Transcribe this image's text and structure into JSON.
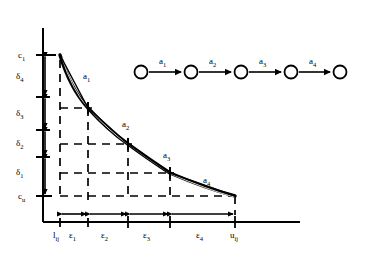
{
  "figure": {
    "stroke_color": "#000000",
    "background": "#ffffff"
  },
  "axes": {
    "y_axis_name": "cost-axis",
    "x_axis_name": "flow-axis",
    "origin": {
      "x": 43,
      "y": 222
    },
    "y_top": {
      "x": 43,
      "y": 28
    },
    "x_right": {
      "x": 300,
      "y": 222
    }
  },
  "y_labels": [
    {
      "id": "c1",
      "text": "c",
      "sub": "1",
      "y": 55
    },
    {
      "id": "delta4",
      "text": "δ",
      "sub": "4",
      "y": 76
    },
    {
      "id": "delta3",
      "text": "δ",
      "sub": "3",
      "y": 113
    },
    {
      "id": "delta2",
      "text": "δ",
      "sub": "2",
      "y": 143
    },
    {
      "id": "delta1",
      "text": "δ",
      "sub": "1",
      "y": 172
    },
    {
      "id": "cu",
      "text": "c",
      "sub": "u",
      "y": 196
    }
  ],
  "y_ticks": [
    55,
    97,
    130,
    157,
    196
  ],
  "delta_spans": [
    {
      "label": "delta4",
      "y_from": 55,
      "y_to": 97
    },
    {
      "label": "delta3",
      "y_from": 97,
      "y_to": 130
    },
    {
      "label": "delta2",
      "y_from": 130,
      "y_to": 157
    },
    {
      "label": "delta1",
      "y_from": 157,
      "y_to": 196
    }
  ],
  "x_labels": [
    {
      "id": "l_ij",
      "text": "l",
      "sub": "ij",
      "x": 58
    },
    {
      "id": "eps1",
      "text": "ε",
      "sub": "1",
      "x": 77
    },
    {
      "id": "eps2",
      "text": "ε",
      "sub": "2",
      "x": 108
    },
    {
      "id": "eps3",
      "text": "ε",
      "sub": "3",
      "x": 150
    },
    {
      "id": "eps4",
      "text": "ε",
      "sub": "4",
      "x": 203
    },
    {
      "id": "u_ij",
      "text": "u",
      "sub": "ij",
      "x": 236
    }
  ],
  "x_ticks": [
    60,
    88,
    128,
    170,
    235
  ],
  "eps_spans": [
    {
      "label": "eps1",
      "x_from": 60,
      "x_to": 88
    },
    {
      "label": "eps2",
      "x_from": 88,
      "x_to": 128
    },
    {
      "label": "eps3",
      "x_from": 128,
      "x_to": 170
    },
    {
      "label": "eps4",
      "x_from": 170,
      "x_to": 235
    }
  ],
  "curve": {
    "name": "piecewise-linear-convex-cost-curve",
    "points": [
      {
        "x": 60,
        "y": 55
      },
      {
        "x": 88,
        "y": 108
      },
      {
        "x": 128,
        "y": 144
      },
      {
        "x": 170,
        "y": 173
      },
      {
        "x": 235,
        "y": 196
      }
    ],
    "segment_labels": [
      {
        "id": "seg_a1",
        "text": "a",
        "sub": "1",
        "x": 83,
        "y": 76
      },
      {
        "id": "seg_a2",
        "text": "a",
        "sub": "2",
        "x": 122,
        "y": 124
      },
      {
        "id": "seg_a3",
        "text": "a",
        "sub": "3",
        "x": 163,
        "y": 155
      },
      {
        "id": "seg_a4",
        "text": "a",
        "sub": "4",
        "x": 203,
        "y": 180
      }
    ]
  },
  "chain_graph": {
    "name": "arc-chain-diagram",
    "node_radius": 6.5,
    "node_y": 72,
    "nodes": [
      {
        "id": "n1",
        "x": 141
      },
      {
        "id": "n2",
        "x": 191
      },
      {
        "id": "n3",
        "x": 241
      },
      {
        "id": "n4",
        "x": 291
      },
      {
        "id": "n5",
        "x": 340
      }
    ],
    "arcs": [
      {
        "id": "arc_a1",
        "text": "a",
        "sub": "1",
        "from": 141,
        "to": 191,
        "label_x": 163,
        "label_y": 60
      },
      {
        "id": "arc_a2",
        "text": "a",
        "sub": "2",
        "from": 191,
        "to": 241,
        "label_x": 213,
        "label_y": 60
      },
      {
        "id": "arc_a3",
        "text": "a",
        "sub": "3",
        "from": 241,
        "to": 291,
        "label_x": 263,
        "label_y": 60
      },
      {
        "id": "arc_a4",
        "text": "a",
        "sub": "4",
        "from": 291,
        "to": 340,
        "label_x": 313,
        "label_y": 60
      }
    ]
  }
}
